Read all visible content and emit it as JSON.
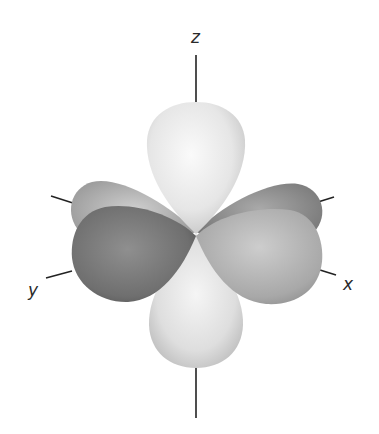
{
  "diagram": {
    "type": "orbital-3d",
    "axes": {
      "z": {
        "label": "z"
      },
      "y": {
        "label": "y"
      },
      "x": {
        "label": "x"
      }
    },
    "lobes": [
      {
        "name": "top",
        "shade": "light"
      },
      {
        "name": "bottom",
        "shade": "light"
      },
      {
        "name": "back-left",
        "shade": "medium"
      },
      {
        "name": "back-right",
        "shade": "dark-medium"
      },
      {
        "name": "front-left",
        "shade": "dark"
      },
      {
        "name": "front-right",
        "shade": "medium"
      }
    ],
    "colors": {
      "light_lobe": "#eeeeee",
      "medium_lobe": "#b5b5b5",
      "dark_lobe": "#7a7a7a",
      "axis_line": "#222222"
    }
  }
}
